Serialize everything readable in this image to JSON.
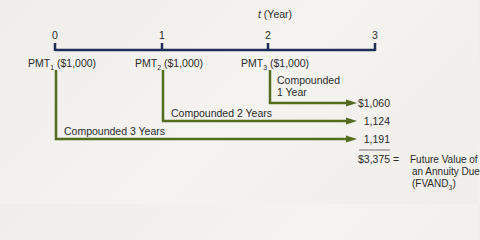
{
  "axis": {
    "title_var": "t",
    "title_unit": "(Year)",
    "ticks": [
      "0",
      "1",
      "2",
      "3"
    ],
    "color": "#1f2d5a"
  },
  "payments": [
    {
      "label": "PMT",
      "sub": "1",
      "amount": "($1,000)"
    },
    {
      "label": "PMT",
      "sub": "2",
      "amount": "($1,000)"
    },
    {
      "label": "PMT",
      "sub": "3",
      "amount": "($1,000)"
    }
  ],
  "flows": [
    {
      "label_line1": "Compounded",
      "label_line2": "1 Year",
      "value": "$1,060"
    },
    {
      "label": "Compounded 2 Years",
      "value": "1,124"
    },
    {
      "label": "Compounded 3 Years",
      "value": "1,191"
    }
  ],
  "total": {
    "value": "$3,375",
    "equals": "=",
    "desc_line1": "Future Value of",
    "desc_line2": "an Annuity Due",
    "desc_line3_pre": "(FVAND",
    "desc_line3_sub": "3",
    "desc_line3_post": ")"
  },
  "colors": {
    "flow": "#556b1f",
    "axis": "#1f2d5a",
    "text": "#2b2b2b"
  }
}
